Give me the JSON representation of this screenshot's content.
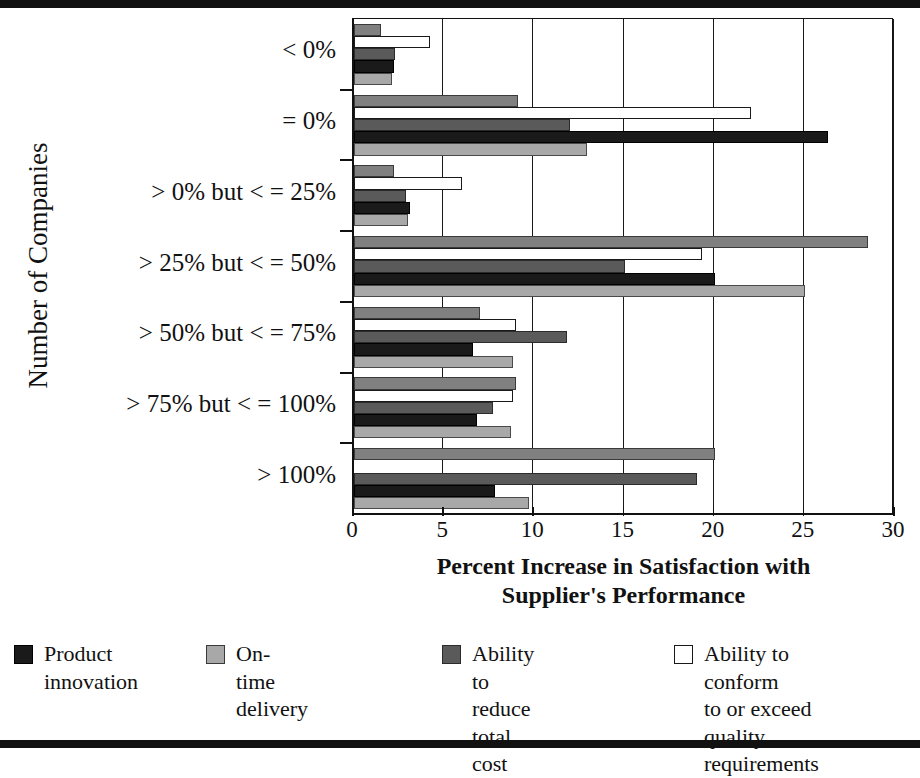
{
  "chart_data": {
    "type": "bar",
    "orientation": "horizontal",
    "title": "",
    "xlabel": "Percent Increase in Satisfaction with Supplier's Performance",
    "ylabel": "Number of Companies",
    "xlim": [
      0,
      30
    ],
    "xticks": [
      0,
      5,
      10,
      15,
      20,
      25,
      30
    ],
    "xticklabels": [
      "0",
      "5",
      "10",
      "15",
      "20",
      "25",
      "30"
    ],
    "grid": true,
    "legend_position": "bottom",
    "categories": [
      "< 0%",
      "= 0%",
      "> 0% but < = 25%",
      "> 25% but < = 50%",
      "> 50% but < = 75%",
      "> 75% but < = 100%",
      "> 100%"
    ],
    "series": [
      {
        "name": "series-medium-gray",
        "color": "#808080",
        "values": [
          1.5,
          9.1,
          2.2,
          28.5,
          7.0,
          9.0,
          20.0
        ]
      },
      {
        "name": "Ability to conform to or exceed quality requirements",
        "color": "#ffffff",
        "values": [
          4.2,
          22.0,
          6.0,
          19.3,
          9.0,
          8.8,
          0.0
        ]
      },
      {
        "name": "Ability to reduce total cost",
        "color": "#5a5a5a",
        "values": [
          2.3,
          12.0,
          2.9,
          15.0,
          11.8,
          7.7,
          19.0
        ]
      },
      {
        "name": "Product innovation",
        "color": "#1a1a1a",
        "values": [
          2.2,
          26.3,
          3.1,
          20.0,
          6.6,
          6.8,
          7.8
        ]
      },
      {
        "name": "On-time delivery",
        "color": "#a8a8a8",
        "values": [
          2.1,
          12.9,
          3.0,
          25.0,
          8.8,
          8.7,
          9.7
        ]
      }
    ]
  },
  "axes": {
    "ylabel": "Number of Companies",
    "xlabel_line1": "Percent Increase in Satisfaction with",
    "xlabel_line2": "Supplier's Performance",
    "xticklabels": [
      "0",
      "5",
      "10",
      "15",
      "20",
      "25",
      "30"
    ],
    "categories": [
      "< 0%",
      "= 0%",
      "> 0% but < = 25%",
      "> 25% but < = 50%",
      "> 50% but < = 75%",
      "> 75% but < = 100%",
      "> 100%"
    ]
  },
  "legend": {
    "items": [
      {
        "label_line1": "Product",
        "label_line2": "innovation",
        "label_line3": "",
        "label_line4": "",
        "swatch": "black"
      },
      {
        "label_line1": "On-time delivery",
        "label_line2": "",
        "label_line3": "",
        "label_line4": "",
        "swatch": "light-gray"
      },
      {
        "label_line1": "Ability to reduce",
        "label_line2": "total cost",
        "label_line3": "",
        "label_line4": "",
        "swatch": "dark-gray"
      },
      {
        "label_line1": "Ability to conform",
        "label_line2": "to or exceed",
        "label_line3": "quality requirements",
        "label_line4": "",
        "swatch": "white"
      }
    ]
  }
}
